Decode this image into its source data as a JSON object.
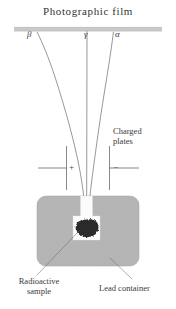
{
  "diagram": {
    "title": "Photographic film",
    "rays": [
      {
        "id": "beta",
        "symbol": "β",
        "name": "beta-ray"
      },
      {
        "id": "gamma",
        "symbol": "γ",
        "name": "gamma-ray"
      },
      {
        "id": "alpha",
        "symbol": "α",
        "name": "alpha-ray"
      }
    ],
    "plates": {
      "label_line1": "Charged",
      "label_line2": "plates",
      "positive_sign": "+",
      "negative_sign": "−"
    },
    "source": {
      "sample_label_line1": "Radioactive",
      "sample_label_line2": "sample",
      "container_label": "Lead container"
    },
    "colors": {
      "background": "#ffffff",
      "ink": "#3a3a3a",
      "trajectory": "#555555",
      "film_strip": "#b9b9b9",
      "lead_container": "#b2b2b2",
      "lead_speckle": "#8d8d8d",
      "sample_blob": "#2a2a2a",
      "cavity": "#fdfdfd"
    }
  }
}
